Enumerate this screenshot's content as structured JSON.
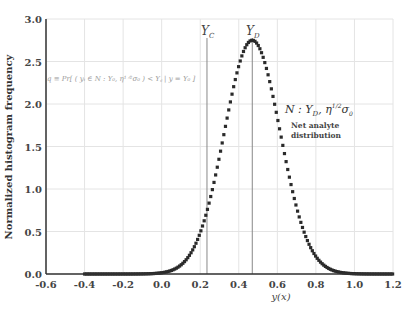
{
  "chart_data": {
    "type": "scatter",
    "title": "",
    "xlabel": "y(x)",
    "ylabel": "Normalized histogram frequency",
    "xlim": [
      -0.6,
      1.2
    ],
    "ylim": [
      0.0,
      3.0
    ],
    "xticks": [
      "-0.6",
      "-0.4",
      "-0.2",
      "0.0",
      "0.2",
      "0.4",
      "0.6",
      "0.8",
      "1.0",
      "1.2"
    ],
    "yticks": [
      "0.0",
      "0.5",
      "1.0",
      "1.5",
      "2.0",
      "2.5",
      "3.0"
    ],
    "grid": true,
    "series": [
      {
        "name": "Net analyte distribution",
        "distribution": "normal",
        "mean": 0.47,
        "sigma": 0.145,
        "peak": 2.75,
        "x_range": [
          -0.4,
          1.2
        ],
        "marker": "square",
        "color": "#2a2a2a",
        "sample_points": [
          {
            "x": -0.4,
            "y": 0.0
          },
          {
            "x": 0.0,
            "y": 0.01
          },
          {
            "x": 0.1,
            "y": 0.11
          },
          {
            "x": 0.2,
            "y": 0.48
          },
          {
            "x": 0.3,
            "y": 1.39
          },
          {
            "x": 0.4,
            "y": 2.46
          },
          {
            "x": 0.47,
            "y": 2.75
          },
          {
            "x": 0.5,
            "y": 2.7
          },
          {
            "x": 0.6,
            "y": 1.85
          },
          {
            "x": 0.7,
            "y": 0.78
          },
          {
            "x": 0.8,
            "y": 0.21
          },
          {
            "x": 0.9,
            "y": 0.03
          },
          {
            "x": 1.0,
            "y": 0.0
          },
          {
            "x": 1.2,
            "y": 0.0
          }
        ]
      }
    ],
    "vlines": [
      {
        "label": "Y_C",
        "x": 0.235
      },
      {
        "label": "Y_D",
        "x": 0.47
      }
    ],
    "annotations": [
      {
        "text": "q ≡ Pr[(yᵢ ∈ N : Y_D, η^{1/2}σ₀) < Y_C | y = Y_D]",
        "x": -0.55,
        "y": 2.3
      },
      {
        "text": "N : Y_D, η^{1/2}σ₀",
        "x": 0.8,
        "y": 2.05
      },
      {
        "text": "Net analyte",
        "x": 0.82,
        "y": 1.8
      },
      {
        "text": "distribution",
        "x": 0.82,
        "y": 1.68
      }
    ]
  },
  "labels": {
    "ylabel": "Normalized histogram frequency",
    "xlabel": "y(x)",
    "yc": "Y",
    "yc_sub": "C",
    "yd": "Y",
    "yd_sub": "D",
    "formula": "q ≡ Pr[ ( yᵢ ∈ N : Y₀, η¹ᐟ²σ₀ ) < Y꜀ | y = Y₀ ]",
    "ann_math": "N : Y",
    "ann_math_sub": "D",
    "ann_math_rest": ", η",
    "ann_math_sup": "1/2",
    "ann_math_end": "σ",
    "ann_math_end_sub": "0",
    "ann_line1": "Net analyte",
    "ann_line2": "distribution"
  }
}
